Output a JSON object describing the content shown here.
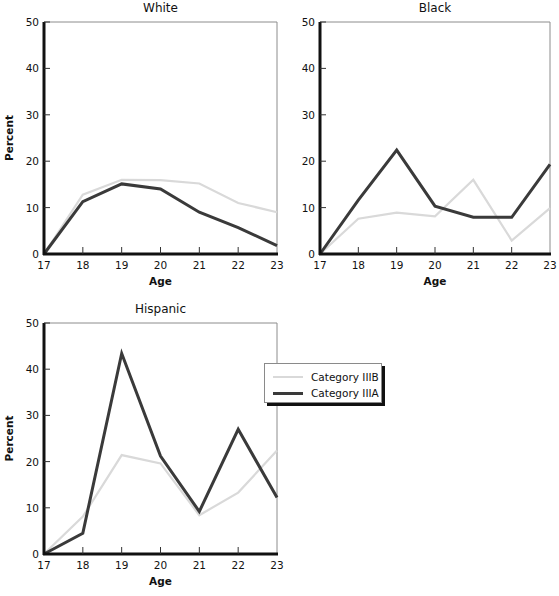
{
  "figure": {
    "legend": {
      "items": [
        {
          "label": "Category IIIB",
          "color": "#d9d9d9"
        },
        {
          "label": "Category IIIA",
          "color": "#3a3a3a"
        }
      ]
    }
  },
  "chart_data": [
    {
      "type": "line",
      "title": "White",
      "xlabel": "Age",
      "ylabel": "Percent",
      "x": [
        17,
        18,
        19,
        20,
        21,
        22,
        23
      ],
      "ylim": [
        0,
        50
      ],
      "yticks": [
        0,
        10,
        20,
        30,
        40,
        50
      ],
      "grid": false,
      "series": [
        {
          "name": "Category IIIB",
          "color": "#d9d9d9",
          "values": [
            0,
            12.8,
            16.0,
            15.9,
            15.2,
            11.0,
            9.0
          ]
        },
        {
          "name": "Category IIIA",
          "color": "#3a3a3a",
          "values": [
            0,
            11.3,
            15.1,
            14.0,
            9.0,
            5.7,
            1.8
          ]
        }
      ],
      "box": {
        "left": 44,
        "top": 22,
        "right": 277,
        "bottom": 254
      },
      "show_ylabel": true
    },
    {
      "type": "line",
      "title": "Black",
      "xlabel": "Age",
      "ylabel": "",
      "x": [
        17,
        18,
        19,
        20,
        21,
        22,
        23
      ],
      "ylim": [
        0,
        50
      ],
      "yticks": [
        0,
        10,
        20,
        30,
        40,
        50
      ],
      "grid": false,
      "series": [
        {
          "name": "Category IIIB",
          "color": "#d9d9d9",
          "values": [
            0,
            7.6,
            8.9,
            8.1,
            16.0,
            2.9,
            9.9
          ]
        },
        {
          "name": "Category IIIA",
          "color": "#3a3a3a",
          "values": [
            0,
            11.6,
            22.4,
            10.3,
            7.9,
            7.9,
            19.3
          ]
        }
      ],
      "box": {
        "left": 320,
        "top": 22,
        "right": 550,
        "bottom": 254
      },
      "show_ylabel": false
    },
    {
      "type": "line",
      "title": "Hispanic",
      "xlabel": "Age",
      "ylabel": "Percent",
      "x": [
        17,
        18,
        19,
        20,
        21,
        22,
        23
      ],
      "ylim": [
        0,
        50
      ],
      "yticks": [
        0,
        10,
        20,
        30,
        40,
        50
      ],
      "grid": false,
      "series": [
        {
          "name": "Category IIIB",
          "color": "#d9d9d9",
          "values": [
            0,
            8.1,
            21.4,
            19.6,
            8.4,
            13.3,
            22.4
          ]
        },
        {
          "name": "Category IIIA",
          "color": "#3a3a3a",
          "values": [
            0,
            4.5,
            43.4,
            21.2,
            9.2,
            27.0,
            12.2
          ]
        }
      ],
      "box": {
        "left": 44,
        "top": 323,
        "right": 277,
        "bottom": 554
      },
      "show_ylabel": true
    }
  ]
}
